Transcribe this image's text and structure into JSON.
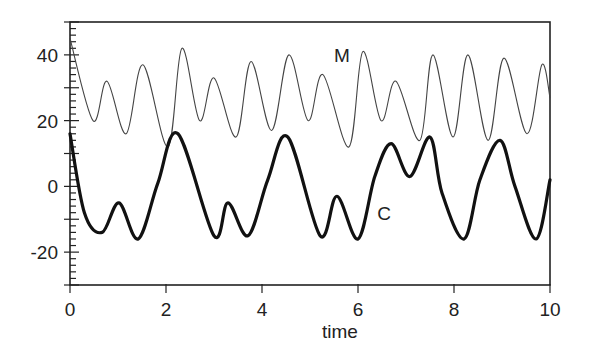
{
  "chart_data": {
    "type": "line",
    "title": "",
    "xlabel": "time",
    "ylabel": "",
    "xlim": [
      0,
      10
    ],
    "ylim": [
      -30,
      50
    ],
    "x_ticks": [
      0,
      2,
      4,
      6,
      8,
      10
    ],
    "x_tick_labels": [
      "0",
      "2",
      "4",
      "6",
      "8",
      "10"
    ],
    "y_ticks": [
      -20,
      0,
      20,
      40
    ],
    "y_tick_labels": [
      "-20",
      "0",
      "20",
      "40"
    ],
    "y_minor_step": 2,
    "y_major_step": 10,
    "grid": false,
    "legend": "inline labels",
    "series": [
      {
        "name": "M",
        "style": "thin",
        "label_position": {
          "x": 5.5,
          "y": 40
        },
        "points": [
          [
            0,
            45
          ],
          [
            0.48,
            20
          ],
          [
            0.77,
            32
          ],
          [
            1.17,
            16
          ],
          [
            1.52,
            37
          ],
          [
            2.04,
            12
          ],
          [
            2.33,
            42
          ],
          [
            2.7,
            20
          ],
          [
            3.0,
            33
          ],
          [
            3.46,
            15
          ],
          [
            3.77,
            38
          ],
          [
            4.2,
            17
          ],
          [
            4.56,
            40
          ],
          [
            4.96,
            20
          ],
          [
            5.27,
            34
          ],
          [
            5.81,
            12
          ],
          [
            6.1,
            41
          ],
          [
            6.48,
            20
          ],
          [
            6.79,
            32
          ],
          [
            7.29,
            14
          ],
          [
            7.56,
            40
          ],
          [
            7.98,
            15
          ],
          [
            8.29,
            40
          ],
          [
            8.71,
            14
          ],
          [
            9.04,
            39
          ],
          [
            9.52,
            16
          ],
          [
            9.83,
            37
          ],
          [
            10,
            27
          ]
        ]
      },
      {
        "name": "C",
        "style": "thick",
        "label_position": {
          "x": 6.4,
          "y": -8
        },
        "points": [
          [
            0,
            16
          ],
          [
            0.3,
            -8
          ],
          [
            0.67,
            -14
          ],
          [
            1.02,
            -5
          ],
          [
            1.42,
            -16
          ],
          [
            1.83,
            1
          ],
          [
            2.25,
            16
          ],
          [
            3.0,
            -15
          ],
          [
            3.29,
            -5
          ],
          [
            3.71,
            -15
          ],
          [
            4.12,
            2
          ],
          [
            4.54,
            15
          ],
          [
            5.21,
            -15
          ],
          [
            5.56,
            -3
          ],
          [
            6.0,
            -16
          ],
          [
            6.35,
            3
          ],
          [
            6.69,
            13
          ],
          [
            7.08,
            3
          ],
          [
            7.5,
            15
          ],
          [
            7.75,
            -2
          ],
          [
            8.21,
            -16
          ],
          [
            8.54,
            2
          ],
          [
            8.96,
            14
          ],
          [
            9.27,
            0
          ],
          [
            9.71,
            -16
          ],
          [
            10,
            2
          ]
        ]
      }
    ]
  }
}
